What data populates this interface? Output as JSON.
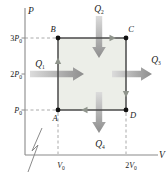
{
  "axes": {
    "p_label": "P",
    "v_label": "V",
    "p_ticks": [
      {
        "pre": "3",
        "var": "P",
        "sub": "0"
      },
      {
        "pre": "2",
        "var": "P",
        "sub": "0"
      },
      {
        "pre": "",
        "var": "P",
        "sub": "0"
      }
    ],
    "v_ticks": [
      {
        "pre": "",
        "var": "V",
        "sub": "0"
      },
      {
        "pre": "2",
        "var": "V",
        "sub": "0"
      }
    ]
  },
  "vertices": {
    "top_left": "B",
    "top_right": "C",
    "bottom_left": "A",
    "bottom_right": "D"
  },
  "heat_flows": {
    "left": {
      "text": "Q",
      "sub": "1",
      "arrow": "points right, into left side of square"
    },
    "top": {
      "text": "Q",
      "sub": "2",
      "arrow": "points down, into top side of square"
    },
    "right": {
      "text": "Q",
      "sub": "3",
      "arrow": "points right, out of right side of square"
    },
    "bottom": {
      "text": "Q",
      "sub": "4",
      "arrow": "points down, out of bottom side of square"
    }
  },
  "cycle": {
    "direction": "clockwise",
    "path": "A-B-C-D-A",
    "points": [
      {
        "label": "A",
        "V": "V0",
        "P": "P0"
      },
      {
        "label": "B",
        "V": "V0",
        "P": "3P0"
      },
      {
        "label": "C",
        "V": "2V0",
        "P": "3P0"
      },
      {
        "label": "D",
        "V": "2V0",
        "P": "P0"
      }
    ]
  },
  "colors": {
    "background": "#ffffff",
    "square_fill": "#eceee8",
    "square_border": "#4a4a4a",
    "heat_arrow_light": "#dcdcdc",
    "heat_arrow_dark": "#8d8d8d",
    "edge_arrowhead": "#8f948c",
    "dashed_line": "#a0a0a0",
    "axis": "#8a8a8a",
    "vertex_dot": "#111111",
    "text": "#222222"
  }
}
